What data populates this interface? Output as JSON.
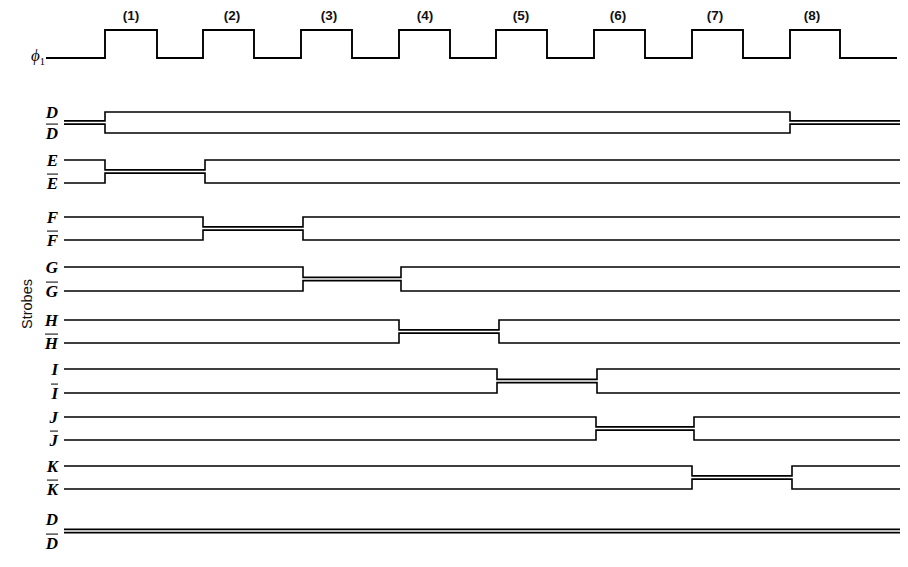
{
  "figure": {
    "axis_caption": "Strobes",
    "clock": {
      "name_label": "ϕ",
      "name_sub": "1",
      "cycle_labels": [
        "(1)",
        "(2)",
        "(3)",
        "(4)",
        "(5)",
        "(6)",
        "(7)",
        "(8)"
      ],
      "cycle_label_x": [
        131,
        232,
        329,
        425,
        521,
        618,
        715,
        812
      ],
      "cycle_label_y": 8,
      "baseline_y": 58,
      "high_y": 30,
      "start_x": 46,
      "end_x": 897,
      "rise_x": [
        105,
        203,
        301,
        399,
        496,
        594,
        692,
        790
      ],
      "fall_x": [
        157,
        254,
        352,
        450,
        547,
        645,
        743,
        840
      ]
    },
    "line_color": "#000000",
    "background": "#ffffff",
    "wire_start_x": 64,
    "wire_end_x": 900,
    "signals": [
      {
        "name": "D",
        "bar_name": "D",
        "label_true": "D",
        "label_comp": "D",
        "y_true": 112,
        "y_comp": 133,
        "y_mid": 122.5,
        "merge_segments": [
          [
            64,
            105
          ],
          [
            790,
            900
          ]
        ],
        "split_segments": [
          [
            105,
            790
          ]
        ]
      },
      {
        "name": "E",
        "label_true": "E",
        "label_comp": "E",
        "y_true": 160,
        "y_comp": 183,
        "y_mid": 171.5,
        "merge_segments": [
          [
            105,
            205
          ]
        ],
        "split_segments": [
          [
            64,
            105
          ],
          [
            205,
            900
          ]
        ]
      },
      {
        "name": "F",
        "label_true": "F",
        "label_comp": "F",
        "y_true": 217,
        "y_comp": 240,
        "y_mid": 228.5,
        "merge_segments": [
          [
            203,
            303
          ]
        ],
        "split_segments": [
          [
            64,
            203
          ],
          [
            303,
            900
          ]
        ]
      },
      {
        "name": "G",
        "label_true": "G",
        "label_comp": "G",
        "y_true": 267,
        "y_comp": 291,
        "y_mid": 279,
        "merge_segments": [
          [
            303,
            401
          ]
        ],
        "split_segments": [
          [
            64,
            303
          ],
          [
            401,
            900
          ]
        ]
      },
      {
        "name": "H",
        "label_true": "H",
        "label_comp": "H",
        "y_true": 320,
        "y_comp": 343,
        "y_mid": 331.5,
        "merge_segments": [
          [
            399,
            499
          ]
        ],
        "split_segments": [
          [
            64,
            399
          ],
          [
            499,
            900
          ]
        ]
      },
      {
        "name": "I",
        "label_true": "I",
        "label_comp": "I",
        "y_true": 369,
        "y_comp": 393,
        "y_mid": 381,
        "merge_segments": [
          [
            497,
            597
          ]
        ],
        "split_segments": [
          [
            64,
            497
          ],
          [
            597,
            900
          ]
        ]
      },
      {
        "name": "J",
        "label_true": "J",
        "label_comp": "J",
        "y_true": 417,
        "y_comp": 440,
        "y_mid": 428.5,
        "merge_segments": [
          [
            596,
            694
          ]
        ],
        "split_segments": [
          [
            64,
            596
          ],
          [
            694,
            900
          ]
        ]
      },
      {
        "name": "K",
        "label_true": "K",
        "label_comp": "K",
        "y_true": 466,
        "y_comp": 489,
        "y_mid": 477.5,
        "merge_segments": [
          [
            692,
            792
          ]
        ],
        "split_segments": [
          [
            64,
            692
          ],
          [
            792,
            900
          ]
        ]
      },
      {
        "name": "D2",
        "label_true": "D",
        "label_comp": "D",
        "y_true": 519,
        "y_comp": 543,
        "y_mid": 531,
        "merge_segments": [
          [
            64,
            790
          ],
          [
            790,
            900
          ]
        ],
        "split_segments": []
      }
    ]
  }
}
